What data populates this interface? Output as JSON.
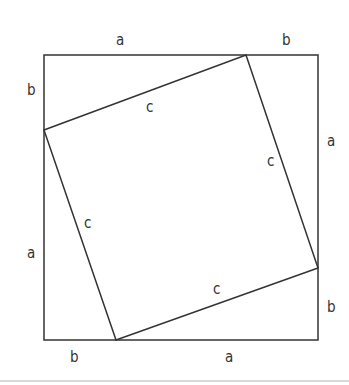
{
  "diagram": {
    "outer_square": {
      "corners": [
        [
          44,
          55
        ],
        [
          318,
          55
        ],
        [
          318,
          340
        ],
        [
          44,
          340
        ]
      ]
    },
    "inner_square": {
      "corners": [
        [
          246,
          55
        ],
        [
          318,
          268
        ],
        [
          116,
          340
        ],
        [
          44,
          130
        ]
      ]
    },
    "labels": {
      "top_a": "a",
      "top_b": "b",
      "right_a": "a",
      "right_b": "b",
      "bottom_b": "b",
      "bottom_a": "a",
      "left_b": "b",
      "left_a": "a",
      "c_top": "c",
      "c_right": "c",
      "c_bottom": "c",
      "c_left": "c"
    }
  }
}
